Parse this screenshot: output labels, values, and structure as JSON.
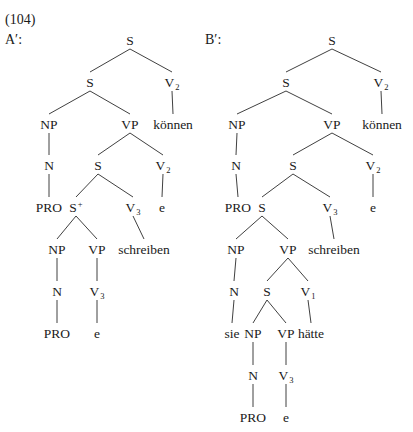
{
  "example": {
    "number": "(104)",
    "labels": {
      "a": "A′:",
      "b": "B′:"
    }
  },
  "trees": [
    {
      "id": "A-prime",
      "label": "A′:",
      "nodes": [
        {
          "id": "a1",
          "text": "S",
          "x": 130,
          "y": 40
        },
        {
          "id": "a2",
          "text": "S",
          "x": 90,
          "y": 82
        },
        {
          "id": "a3",
          "text": "V",
          "sub": "2",
          "x": 172,
          "y": 82
        },
        {
          "id": "a4",
          "text": "NP",
          "x": 49,
          "y": 124
        },
        {
          "id": "a5",
          "text": "VP",
          "x": 130,
          "y": 124
        },
        {
          "id": "a6",
          "text": "können",
          "x": 173,
          "y": 124
        },
        {
          "id": "a7",
          "text": "N",
          "x": 49,
          "y": 165
        },
        {
          "id": "a8",
          "text": "S",
          "x": 98,
          "y": 165
        },
        {
          "id": "a9",
          "text": "V",
          "sub": "2",
          "x": 163,
          "y": 165
        },
        {
          "id": "a10",
          "text": "PRO",
          "x": 49,
          "y": 207
        },
        {
          "id": "a11",
          "text": "S",
          "sup": "+",
          "x": 76,
          "y": 207
        },
        {
          "id": "a12",
          "text": "V",
          "sub": "3",
          "x": 133,
          "y": 207
        },
        {
          "id": "a13",
          "text": "e",
          "x": 162,
          "y": 207
        },
        {
          "id": "a14",
          "text": "NP",
          "x": 57,
          "y": 249
        },
        {
          "id": "a15",
          "text": "VP",
          "x": 97,
          "y": 249
        },
        {
          "id": "a16",
          "text": "schreiben",
          "x": 144,
          "y": 249
        },
        {
          "id": "a17",
          "text": "N",
          "x": 57,
          "y": 291
        },
        {
          "id": "a18",
          "text": "V",
          "sub": "3",
          "x": 97,
          "y": 291
        },
        {
          "id": "a19",
          "text": "PRO",
          "x": 57,
          "y": 333
        },
        {
          "id": "a20",
          "text": "e",
          "x": 97,
          "y": 333
        }
      ],
      "edges": [
        [
          "a1",
          "a2"
        ],
        [
          "a1",
          "a3"
        ],
        [
          "a2",
          "a4"
        ],
        [
          "a2",
          "a5"
        ],
        [
          "a3",
          "a6"
        ],
        [
          "a4",
          "a7"
        ],
        [
          "a5",
          "a8"
        ],
        [
          "a5",
          "a9"
        ],
        [
          "a7",
          "a10"
        ],
        [
          "a8",
          "a11"
        ],
        [
          "a8",
          "a12"
        ],
        [
          "a9",
          "a13"
        ],
        [
          "a11",
          "a14"
        ],
        [
          "a11",
          "a15"
        ],
        [
          "a12",
          "a16"
        ],
        [
          "a14",
          "a17"
        ],
        [
          "a15",
          "a18"
        ],
        [
          "a17",
          "a19"
        ],
        [
          "a18",
          "a20"
        ]
      ]
    },
    {
      "id": "B-prime",
      "label": "B′:",
      "nodes": [
        {
          "id": "b1",
          "text": "S",
          "x": 332,
          "y": 40
        },
        {
          "id": "b2",
          "text": "S",
          "x": 286,
          "y": 82
        },
        {
          "id": "b3",
          "text": "V",
          "sub": "2",
          "x": 381,
          "y": 82
        },
        {
          "id": "b4",
          "text": "NP",
          "x": 237,
          "y": 124
        },
        {
          "id": "b5",
          "text": "VP",
          "x": 332,
          "y": 124
        },
        {
          "id": "b6",
          "text": "können",
          "x": 382,
          "y": 124
        },
        {
          "id": "b7",
          "text": "N",
          "x": 236,
          "y": 165
        },
        {
          "id": "b8",
          "text": "S",
          "x": 293,
          "y": 165
        },
        {
          "id": "b9",
          "text": "V",
          "sub": "2",
          "x": 373,
          "y": 165
        },
        {
          "id": "b10",
          "text": "PRO",
          "x": 238,
          "y": 207
        },
        {
          "id": "b11",
          "text": "S",
          "x": 262,
          "y": 207
        },
        {
          "id": "b12",
          "text": "V",
          "sub": "3",
          "x": 330,
          "y": 207
        },
        {
          "id": "b13",
          "text": "e",
          "x": 373,
          "y": 207
        },
        {
          "id": "b14",
          "text": "NP",
          "x": 236,
          "y": 249
        },
        {
          "id": "b15",
          "text": "VP",
          "x": 288,
          "y": 249
        },
        {
          "id": "b16",
          "text": "schreiben",
          "x": 334,
          "y": 249
        },
        {
          "id": "b17",
          "text": "N",
          "x": 234,
          "y": 291
        },
        {
          "id": "b18",
          "text": "S",
          "x": 267,
          "y": 291
        },
        {
          "id": "b19",
          "text": "V",
          "sub": "1",
          "x": 308,
          "y": 291
        },
        {
          "id": "b20",
          "text": "sie",
          "x": 232,
          "y": 333
        },
        {
          "id": "b21",
          "text": "NP",
          "x": 253,
          "y": 333
        },
        {
          "id": "b22",
          "text": "VP",
          "x": 286,
          "y": 333
        },
        {
          "id": "b23",
          "text": "hätte",
          "x": 311,
          "y": 333
        },
        {
          "id": "b24",
          "text": "N",
          "x": 253,
          "y": 375
        },
        {
          "id": "b25",
          "text": "V",
          "sub": "3",
          "x": 286,
          "y": 375
        },
        {
          "id": "b26",
          "text": "PRO",
          "x": 253,
          "y": 417
        },
        {
          "id": "b27",
          "text": "e",
          "x": 286,
          "y": 417
        }
      ],
      "edges": [
        [
          "b1",
          "b2"
        ],
        [
          "b1",
          "b3"
        ],
        [
          "b2",
          "b4"
        ],
        [
          "b2",
          "b5"
        ],
        [
          "b3",
          "b6"
        ],
        [
          "b4",
          "b7"
        ],
        [
          "b5",
          "b8"
        ],
        [
          "b5",
          "b9"
        ],
        [
          "b7",
          "b10"
        ],
        [
          "b8",
          "b11"
        ],
        [
          "b8",
          "b12"
        ],
        [
          "b9",
          "b13"
        ],
        [
          "b11",
          "b14"
        ],
        [
          "b11",
          "b15"
        ],
        [
          "b12",
          "b16"
        ],
        [
          "b14",
          "b17"
        ],
        [
          "b15",
          "b18"
        ],
        [
          "b15",
          "b19"
        ],
        [
          "b17",
          "b20"
        ],
        [
          "b18",
          "b21"
        ],
        [
          "b18",
          "b22"
        ],
        [
          "b19",
          "b23"
        ],
        [
          "b21",
          "b24"
        ],
        [
          "b22",
          "b25"
        ],
        [
          "b24",
          "b26"
        ],
        [
          "b25",
          "b27"
        ]
      ]
    }
  ]
}
